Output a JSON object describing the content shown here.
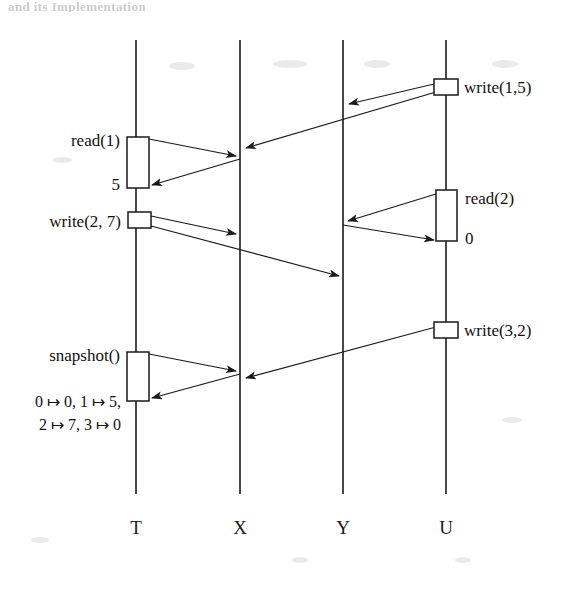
{
  "page": {
    "header_ghost_text": "and its Implementation",
    "background_color": "#ffffff",
    "ink_color": "#1a1a1a",
    "width": 564,
    "height": 595
  },
  "diagram": {
    "type": "sequence-diagram",
    "title": "",
    "lifelines": [
      {
        "id": "T",
        "label": "T",
        "x": 136,
        "top_y": 40,
        "bottom_y": 494,
        "label_y": 527
      },
      {
        "id": "X",
        "label": "X",
        "x": 240,
        "top_y": 40,
        "bottom_y": 494,
        "label_y": 527
      },
      {
        "id": "Y",
        "label": "Y",
        "x": 343,
        "top_y": 40,
        "bottom_y": 494,
        "label_y": 527
      },
      {
        "id": "U",
        "label": "U",
        "x": 446,
        "top_y": 40,
        "bottom_y": 494,
        "label_y": 527
      }
    ],
    "events": [
      {
        "id": "write15",
        "label": "write(1,5)",
        "lifeline": "U",
        "label_side": "right",
        "box": {
          "x": 434,
          "y": 79,
          "w": 24,
          "h": 16
        }
      },
      {
        "id": "read1",
        "label": "read(1)",
        "result": "5",
        "lifeline": "T",
        "label_side": "left",
        "box": {
          "x": 127,
          "y": 137,
          "w": 22,
          "h": 51
        }
      },
      {
        "id": "read2",
        "label": "read(2)",
        "result": "0",
        "lifeline": "U",
        "label_side": "right",
        "box": {
          "x": 436,
          "y": 190,
          "w": 21,
          "h": 51
        }
      },
      {
        "id": "write27",
        "label": "write(2, 7)",
        "lifeline": "T",
        "label_side": "left",
        "box": {
          "x": 128,
          "y": 212,
          "w": 23,
          "h": 16
        }
      },
      {
        "id": "write32",
        "label": "write(3,2)",
        "lifeline": "U",
        "label_side": "right",
        "box": {
          "x": 434,
          "y": 322,
          "w": 24,
          "h": 16
        }
      },
      {
        "id": "snapshot",
        "label": "snapshot()",
        "result": "0 ↦ 0, 1 ↦ 5,\n2 ↦ 7, 3 ↦ 0",
        "lifeline": "T",
        "label_side": "left",
        "box": {
          "x": 127,
          "y": 352,
          "w": 22,
          "h": 49
        }
      }
    ],
    "messages": [
      {
        "id": "m1",
        "from": "U",
        "to": "Y",
        "x1": 434,
        "y1": 84,
        "x2": 345,
        "y2": 105,
        "direction": "left"
      },
      {
        "id": "m2",
        "from": "U",
        "to": "X",
        "x1": 434,
        "y1": 92,
        "x2": 242,
        "y2": 149,
        "direction": "left"
      },
      {
        "id": "m3",
        "from": "T",
        "to": "X",
        "x1": 149,
        "y1": 139,
        "x2": 238,
        "y2": 157,
        "direction": "right"
      },
      {
        "id": "m4",
        "from": "X",
        "to": "T",
        "x1": 242,
        "y1": 159,
        "x2": 150,
        "y2": 186,
        "direction": "left"
      },
      {
        "id": "m5",
        "from": "U",
        "to": "Y",
        "x1": 436,
        "y1": 194,
        "x2": 345,
        "y2": 222,
        "direction": "left"
      },
      {
        "id": "m6",
        "from": "Y",
        "to": "U",
        "x1": 341,
        "y1": 224,
        "x2": 436,
        "y2": 240,
        "direction": "right"
      },
      {
        "id": "m7",
        "from": "T",
        "to": "X",
        "x1": 151,
        "y1": 216,
        "x2": 238,
        "y2": 235,
        "direction": "right"
      },
      {
        "id": "m8",
        "from": "T",
        "to": "Y",
        "x1": 151,
        "y1": 226,
        "x2": 341,
        "y2": 277,
        "direction": "right"
      },
      {
        "id": "m9",
        "from": "U",
        "to": "X",
        "x1": 434,
        "y1": 327,
        "x2": 242,
        "y2": 379,
        "direction": "left"
      },
      {
        "id": "m10",
        "from": "T",
        "to": "X",
        "x1": 149,
        "y1": 354,
        "x2": 238,
        "y2": 372,
        "direction": "right"
      },
      {
        "id": "m11",
        "from": "X",
        "to": "T",
        "x1": 242,
        "y1": 374,
        "x2": 150,
        "y2": 399,
        "direction": "left"
      }
    ]
  }
}
